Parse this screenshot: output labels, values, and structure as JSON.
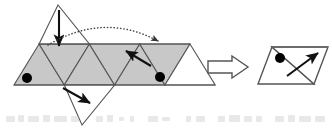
{
  "figure": {
    "type": "geometry-folding-diagram",
    "caption": "",
    "background_color": "#ffffff",
    "stroke_color": "#555555",
    "shaded_fill": "#c8c8c8",
    "unshaded_fill": "#ffffff",
    "marker_color": "#000000"
  },
  "left_figure": {
    "name": "triangle-strip-net",
    "strip": {
      "left_x": 14,
      "right_x": 190,
      "top_y": 44,
      "bottom_y": 85,
      "triangle_count": 7,
      "half_base": 25.14,
      "triangles": [
        {
          "index": 1,
          "orientation": "up",
          "fill": "shaded"
        },
        {
          "index": 2,
          "orientation": "down",
          "fill": "shaded"
        },
        {
          "index": 3,
          "orientation": "up",
          "fill": "shaded"
        },
        {
          "index": 4,
          "orientation": "down",
          "fill": "shaded"
        },
        {
          "index": 5,
          "orientation": "up",
          "fill": "shaded"
        },
        {
          "index": 6,
          "orientation": "down",
          "fill": "shaded"
        },
        {
          "index": 7,
          "orientation": "up",
          "fill": "unshaded"
        }
      ]
    },
    "flaps": [
      {
        "name": "top-flap-triangle",
        "position": "above-strip",
        "orientation": "up",
        "fill": "unshaded",
        "apex_x": 58,
        "apex_y": 5
      },
      {
        "name": "bottom-flap-triangle",
        "position": "below-strip",
        "orientation": "down",
        "fill": "unshaded",
        "apex_x": 82,
        "apex_y": 125
      }
    ],
    "dots": [
      {
        "name": "dot-left",
        "cx": 27,
        "cy": 78,
        "r": 5
      },
      {
        "name": "dot-right",
        "cx": 160,
        "cy": 77,
        "r": 5
      }
    ],
    "arrows": [
      {
        "name": "fold-arrow-down",
        "kind": "solid",
        "x1": 59,
        "y1": 10,
        "x2": 59,
        "y2": 48,
        "label": "fold top flap down"
      },
      {
        "name": "fold-arrow-down-right",
        "kind": "solid",
        "x1": 63,
        "y1": 88,
        "x2": 92,
        "y2": 104,
        "label": "fold bottom flap down-right"
      },
      {
        "name": "fold-arrow-up-left",
        "kind": "solid",
        "x1": 150,
        "y1": 65,
        "x2": 125,
        "y2": 50,
        "label": "fold right panel up-left"
      },
      {
        "name": "transfer-arc",
        "kind": "dotted-curve",
        "x1": 48,
        "y1": 45,
        "cx": 104,
        "cy": 16,
        "x2": 160,
        "y2": 42,
        "label": "move left end across to right end"
      }
    ]
  },
  "transition": {
    "name": "block-arrow-right",
    "glyph": "arrow-right",
    "x": 208,
    "y": 56,
    "width": 40,
    "height": 22
  },
  "right_figure": {
    "name": "folded-rhombus-result",
    "rhombus": {
      "top_left_x": 272,
      "top_left_y": 47,
      "top_right_x": 328,
      "top_right_y": 47,
      "bottom_right_x": 314,
      "bottom_right_y": 84,
      "bottom_left_x": 258,
      "bottom_left_y": 84,
      "fill": "unshaded",
      "divided_into": 2
    },
    "dots": [
      {
        "name": "dot-result",
        "cx": 280,
        "cy": 58,
        "r": 5
      }
    ],
    "arrows": [
      {
        "name": "result-arrow-up-right",
        "kind": "solid",
        "x1": 288,
        "y1": 75,
        "x2": 320,
        "y2": 52,
        "label": "resulting orientation"
      }
    ]
  },
  "artifacts": {
    "name": "scan-noise-row",
    "description": "faint illegible scanned text remnants along bottom edge",
    "legible": false
  }
}
